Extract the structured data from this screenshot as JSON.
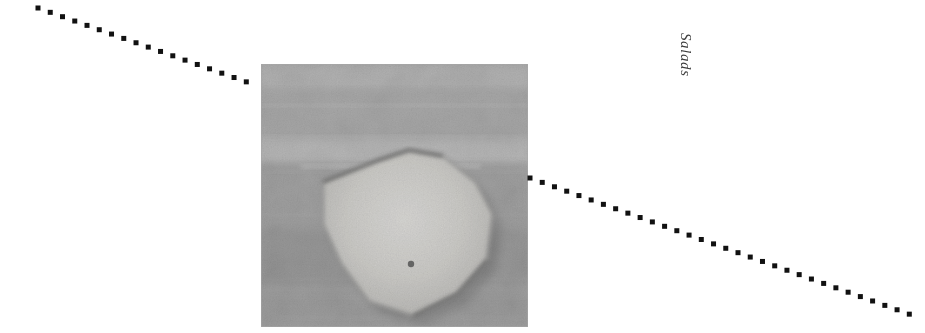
{
  "page": {
    "width": 925,
    "height": 333,
    "background_color": "#ffffff"
  },
  "caption": {
    "text": "Salads",
    "orientation": "vertical-rotated-90",
    "style": "italic-serif",
    "color": "#3c3c3c",
    "x": 678,
    "y": 58
  },
  "rules": [
    {
      "name": "top-left-dotted-rule",
      "style": "square-dotted",
      "color": "#111111",
      "dot_size": 5,
      "dot_pitch": 13,
      "x1": 38,
      "y1": 8,
      "x2": 258,
      "y2": 86
    },
    {
      "name": "lower-right-dotted-rule",
      "style": "square-dotted",
      "color": "#111111",
      "dot_size": 5,
      "dot_pitch": 13,
      "x1": 530,
      "y1": 178,
      "x2": 920,
      "y2": 318
    }
  ],
  "photograph": {
    "name": "salad-plate-photograph",
    "alt": "Grainy black and white photograph of a pale angular plate or dish on a mottled surface",
    "x": 261,
    "y": 64,
    "width": 267,
    "height": 263,
    "tone": "grayscale",
    "base_color": "#b7b7b7",
    "subject_color": "#ededea",
    "shadow_color": "#6f6f6f",
    "bands": [
      {
        "y": 0.0,
        "height": 0.1,
        "color": "#c9c9c9"
      },
      {
        "y": 0.1,
        "height": 0.18,
        "color": "#bdbdbd"
      },
      {
        "y": 0.28,
        "height": 0.1,
        "color": "#cfcfcf"
      },
      {
        "y": 0.38,
        "height": 0.25,
        "color": "#b4b4b4"
      },
      {
        "y": 0.63,
        "height": 0.22,
        "color": "#a9a9a9"
      },
      {
        "y": 0.85,
        "height": 0.15,
        "color": "#b0b0b0"
      }
    ],
    "subject": {
      "name": "pale-angular-dish",
      "points": "62,118 118,96 148,86 182,92 215,118 232,150 226,196 196,230 152,252 108,238 80,200 62,160",
      "speck": {
        "x": 150,
        "y": 200,
        "r": 3.2,
        "color": "#5a5a5a"
      }
    }
  }
}
